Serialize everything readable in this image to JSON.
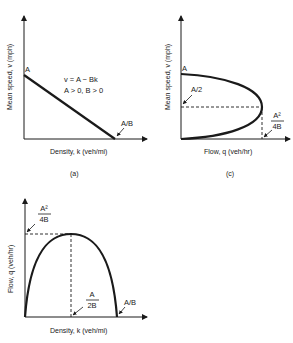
{
  "panels": {
    "a": {
      "caption": "(a)",
      "ylabel": "Mean speed, v (mph)",
      "xlabel": "Density, k (veh/mi)",
      "intercept_label": "A",
      "xintercept_label": "A/B",
      "equation": "v = A − Bk",
      "condition": "A > 0, B > 0"
    },
    "b": {
      "ylabel": "Flow, q (veh/hr)",
      "xlabel": "Density, k (veh/mi)",
      "max_flow_num": "A²",
      "max_flow_den": "4B",
      "optimal_density_num": "A",
      "optimal_density_den": "2B",
      "xintercept_label": "A/B"
    },
    "c": {
      "caption": "(c)",
      "ylabel": "Mean speed, v (mph)",
      "xlabel": "Flow, q (veh/hr)",
      "intercept_label": "A",
      "optimal_speed_label": "A/2",
      "max_flow_num": "A²",
      "max_flow_den": "4B"
    }
  }
}
